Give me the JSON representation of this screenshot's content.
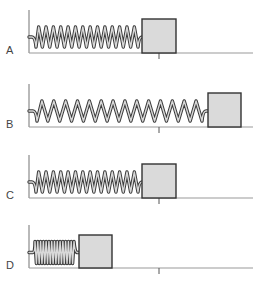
{
  "diagram": {
    "colors": {
      "wall": "#8a8a8a",
      "floor": "#9a9a9a",
      "tick": "#555555",
      "block_fill": "#dadada",
      "block_stroke": "#333333",
      "spring_outline": "#3a3a3a",
      "spring_inner": "#d8d8d8"
    },
    "panels": [
      {
        "label": "A",
        "state": "equilibrium",
        "top": 10,
        "floor_y": 53,
        "spring_start": 35,
        "spring_end": 138,
        "coils": 14,
        "block_x": 142,
        "block_w": 34,
        "block_h": 34
      },
      {
        "label": "B",
        "state": "stretched",
        "top": 84,
        "floor_y": 127,
        "spring_start": 36,
        "spring_end": 202,
        "coils": 14,
        "block_x": 208,
        "block_w": 33,
        "block_h": 34
      },
      {
        "label": "C",
        "state": "equilibrium",
        "top": 155,
        "floor_y": 198,
        "spring_start": 35,
        "spring_end": 138,
        "coils": 14,
        "block_x": 142,
        "block_w": 34,
        "block_h": 34
      },
      {
        "label": "D",
        "state": "compressed",
        "top": 225,
        "floor_y": 268,
        "spring_start": 35,
        "spring_end": 74,
        "coils": 14,
        "block_x": 79,
        "block_w": 33,
        "block_h": 33
      }
    ],
    "wall_x": 29,
    "floor_end_x": 253,
    "tick_x": 159
  }
}
